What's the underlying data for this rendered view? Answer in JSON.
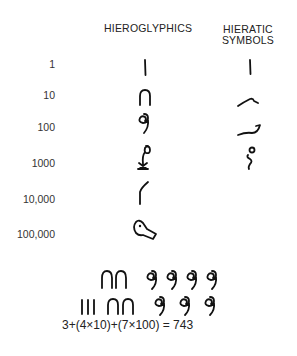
{
  "headers": {
    "hieroglyphics": "HIEROGLYPHICS",
    "hieratic_line1": "HIERATIC",
    "hieratic_line2": "SYMBOLS"
  },
  "rows": [
    {
      "value": "1",
      "hieroglyph": "stroke",
      "hieratic": "stroke"
    },
    {
      "value": "10",
      "hieroglyph": "heel-bone",
      "hieratic": "hook"
    },
    {
      "value": "100",
      "hieroglyph": "coil-of-rope",
      "hieratic": "curved-dash"
    },
    {
      "value": "1000",
      "hieroglyph": "lotus-plant",
      "hieratic": "s-curl"
    },
    {
      "value": "10,000",
      "hieroglyph": "finger",
      "hieratic": ""
    },
    {
      "value": "100,000",
      "hieroglyph": "tadpole",
      "hieratic": ""
    }
  ],
  "example": {
    "line1": "∩∩ 9999",
    "line2": "III ∩∩ 999",
    "equation": "3+(4×10)+(7×100) = 743"
  }
}
